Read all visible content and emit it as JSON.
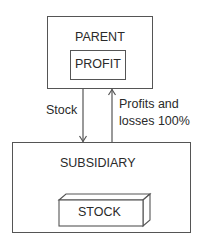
{
  "diagram": {
    "parent": {
      "label": "PARENT",
      "inner_label": "PROFIT"
    },
    "subsidiary": {
      "label": "SUBSIDIARY",
      "inner_label": "STOCK"
    },
    "arrows": [
      {
        "from": "parent",
        "to": "subsidiary",
        "label": "Stock"
      },
      {
        "from": "subsidiary",
        "to": "parent",
        "label_line1": "Profits and",
        "label_line2": "losses 100%"
      }
    ]
  }
}
